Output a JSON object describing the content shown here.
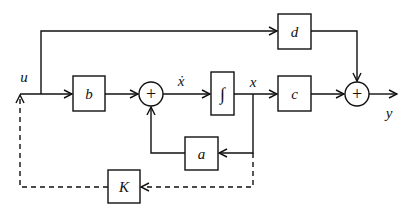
{
  "diagram": {
    "type": "block-diagram",
    "signals": {
      "input": "u",
      "state_derivative": "ẋ",
      "state": "x",
      "output": "y"
    },
    "blocks": {
      "b": "b",
      "integrator": "∫",
      "c": "c",
      "d": "d",
      "a": "a",
      "K": "K"
    },
    "summing_junctions": {
      "sum1": "+",
      "sum2": "+"
    },
    "connections": [
      {
        "from": "u",
        "to": "b"
      },
      {
        "from": "b",
        "to": "sum1"
      },
      {
        "from": "sum1",
        "to": "integrator",
        "label": "ẋ"
      },
      {
        "from": "integrator",
        "to": "c",
        "label": "x"
      },
      {
        "from": "x",
        "to": "a"
      },
      {
        "from": "a",
        "to": "sum1"
      },
      {
        "from": "c",
        "to": "sum2"
      },
      {
        "from": "u",
        "to": "d"
      },
      {
        "from": "d",
        "to": "sum2"
      },
      {
        "from": "sum2",
        "to": "y"
      },
      {
        "from": "x",
        "to": "K",
        "style": "dashed"
      },
      {
        "from": "K",
        "to": "u",
        "style": "dashed"
      }
    ]
  }
}
